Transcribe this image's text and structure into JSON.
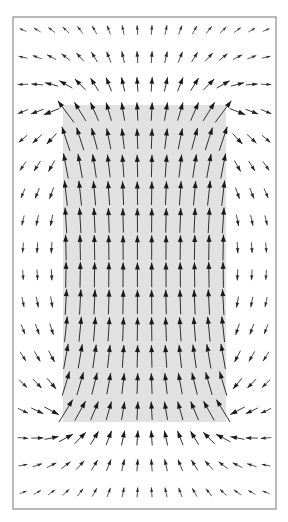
{
  "canvas": {
    "width": 288,
    "height": 522,
    "background": "#ffffff"
  },
  "frame": {
    "x": 13,
    "y": 17,
    "width": 263,
    "height": 492,
    "stroke": "#8c8c8c",
    "stroke_width": 1.2
  },
  "magnet_region": {
    "label": "shaded-rectangle",
    "x": 63,
    "y": 105,
    "width": 163,
    "height": 317,
    "fill": "#e1e1e1"
  },
  "grid": {
    "columns": 18,
    "rows": 18,
    "x0": 23,
    "dx": 14.3,
    "y0": 30,
    "dy": 27.2
  },
  "arrows": {
    "color": "#1a1a1a",
    "max_length": 27,
    "min_length": 2,
    "head_length": 7,
    "head_width": 5,
    "stroke_width": 0.9,
    "direction_inside": "up"
  },
  "chart_data": {
    "type": "vector-field",
    "title": "",
    "grid_columns": 18,
    "grid_rows": 18,
    "region": {
      "cols_inside": [
        3,
        14
      ],
      "rows_inside": [
        3,
        14
      ]
    },
    "inside_direction": "up (+y)",
    "outside_side_direction": "down (-y), weak"
  }
}
